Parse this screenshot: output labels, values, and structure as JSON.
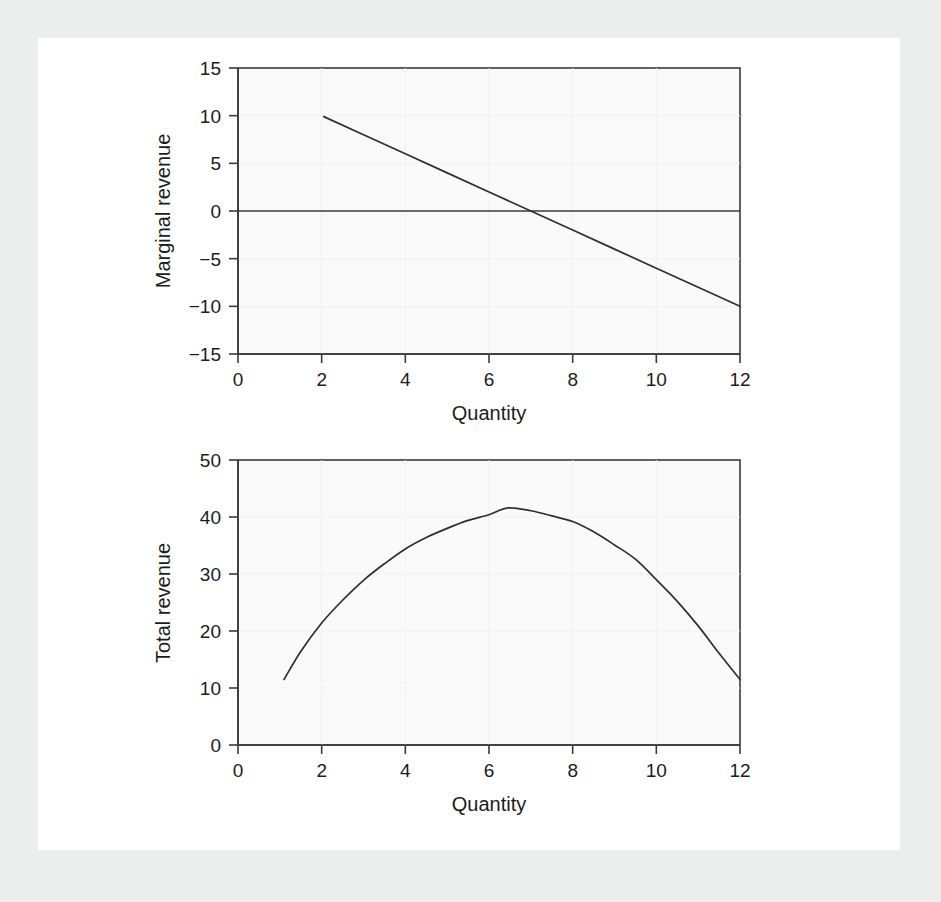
{
  "figure": {
    "background_color": "#eceded",
    "panel_color": "#ffffff",
    "plot_fill": "#fafafa",
    "line_color": "#2f2f2f",
    "axis_color": "#3a3a3a"
  },
  "chart_data": [
    {
      "id": "marginal-revenue",
      "type": "line",
      "title": "",
      "xlabel": "Quantity",
      "ylabel": "Marginal revenue",
      "xlim": [
        0,
        12
      ],
      "ylim": [
        -15,
        15
      ],
      "xticks": [
        0,
        2,
        4,
        6,
        8,
        10,
        12
      ],
      "xticklabels": [
        "0",
        "2",
        "4",
        "6",
        "8",
        "10",
        "12"
      ],
      "yticks": [
        -15,
        -10,
        -5,
        0,
        5,
        10,
        15
      ],
      "yticklabels": [
        "−15",
        "−10",
        "−5",
        "0",
        "5",
        "10",
        "15"
      ],
      "grid": true,
      "legend": "none",
      "zero_line": 0,
      "series": [
        {
          "name": "Marginal revenue",
          "equation": "MR = 14 - 2q",
          "x": [
            2.05,
            3,
            4,
            5,
            6,
            7,
            8,
            9,
            10,
            11,
            12
          ],
          "values": [
            9.9,
            8.0,
            6.0,
            4.0,
            2.0,
            0.0,
            -2.0,
            -4.0,
            -6.0,
            -8.0,
            -10.0
          ]
        }
      ]
    },
    {
      "id": "total-revenue",
      "type": "line",
      "title": "",
      "xlabel": "Quantity",
      "ylabel": "Total revenue",
      "xlim": [
        0,
        12
      ],
      "ylim": [
        0,
        50
      ],
      "xticks": [
        0,
        2,
        4,
        6,
        8,
        10,
        12
      ],
      "xticklabels": [
        "0",
        "2",
        "4",
        "6",
        "8",
        "10",
        "12"
      ],
      "yticks": [
        0,
        10,
        20,
        30,
        40,
        50
      ],
      "yticklabels": [
        "0",
        "10",
        "20",
        "30",
        "40",
        "50"
      ],
      "grid": true,
      "legend": "none",
      "series": [
        {
          "name": "Total revenue",
          "equation": "TR = 12.9q - q²",
          "x": [
            1.1,
            1.5,
            2,
            2.5,
            3,
            3.5,
            4,
            4.5,
            5,
            5.5,
            6,
            6.45,
            7,
            7.5,
            8,
            8.5,
            9,
            9.5,
            10,
            10.5,
            11,
            11.5,
            12
          ],
          "values": [
            11.5,
            16.4,
            21.4,
            25.4,
            28.9,
            31.8,
            34.4,
            36.4,
            38.0,
            39.4,
            40.4,
            41.6,
            41.1,
            40.2,
            39.2,
            37.4,
            35.1,
            32.6,
            29.0,
            25.2,
            20.9,
            16.1,
            11.5
          ]
        }
      ]
    }
  ]
}
